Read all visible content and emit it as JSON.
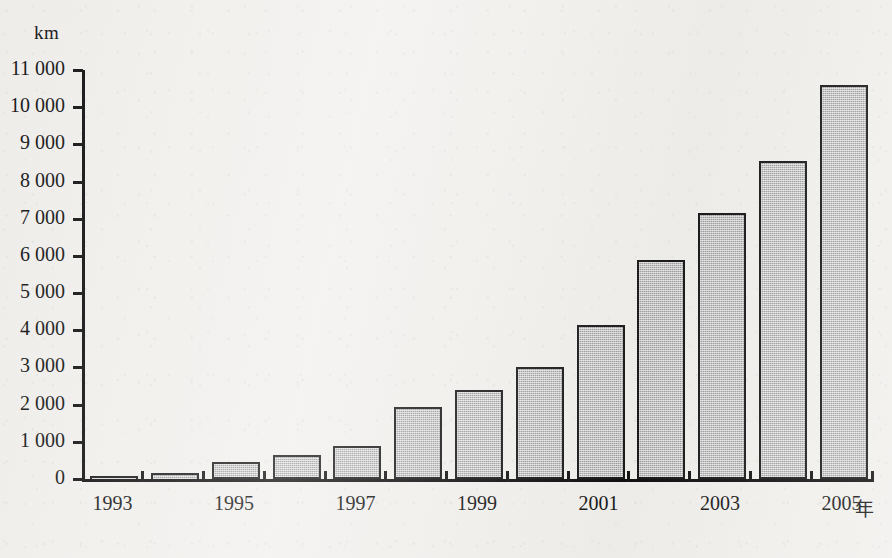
{
  "chart_data": {
    "type": "bar",
    "title": "",
    "subtitle": "",
    "xlabel": "年",
    "ylabel": "km",
    "ylim": [
      0,
      11000
    ],
    "grid": false,
    "legend": "none",
    "y_tick_labels": [
      "11 000",
      "10 000",
      "9 000",
      "8 000",
      "7 000",
      "6 000",
      "5 000",
      "4 000",
      "3 000",
      "2 000",
      "1 000",
      "0"
    ],
    "y_tick_values": [
      11000,
      10000,
      9000,
      8000,
      7000,
      6000,
      5000,
      4000,
      3000,
      2000,
      1000,
      0
    ],
    "x_tick_labels": [
      "1993",
      "1995",
      "1997",
      "1999",
      "2001",
      "2003",
      "2005"
    ],
    "categories": [
      "1993",
      "1994",
      "1995",
      "1996",
      "1997",
      "1998",
      "1999",
      "2000",
      "2001",
      "2002",
      "2003",
      "2004",
      "2005"
    ],
    "values": [
      20,
      170,
      450,
      650,
      900,
      1930,
      2400,
      3000,
      4150,
      5900,
      7150,
      8550,
      10600
    ],
    "bar_fill_color": "#b3b3b3",
    "bar_border_color": "#1b1b1b",
    "background_color": "#f2f1ee"
  }
}
